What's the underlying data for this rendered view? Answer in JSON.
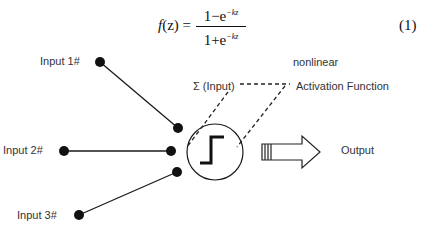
{
  "equation": {
    "lhs_func": "f",
    "lhs_arg": "(z) =",
    "numerator_base": "1−e",
    "numerator_exp": "−kz",
    "denominator_base": "1+e",
    "denominator_exp": "−kz",
    "number": "(1)"
  },
  "inputs": [
    {
      "label": "Input 1#"
    },
    {
      "label": "Input 2#"
    },
    {
      "label": "Input 3#"
    }
  ],
  "neuron": {
    "sum_label": "Σ (Input)",
    "activation_line1": "nonlinear",
    "activation_line2": "Activation Function",
    "icon": "step-function-icon"
  },
  "output": {
    "label": "Output",
    "icon": "hollow-right-arrow-icon"
  },
  "colors": {
    "stroke": "#1a1a1a",
    "text": "#333333",
    "background": "#ffffff"
  }
}
